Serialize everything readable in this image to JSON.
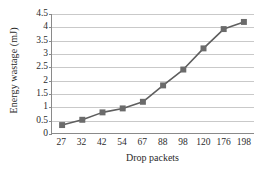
{
  "chart_data": {
    "type": "line",
    "title": "",
    "subtitle": "",
    "xlabel": "Drop packets",
    "ylabel": "Energy wastage (mJ)",
    "categories": [
      "27",
      "32",
      "42",
      "54",
      "67",
      "88",
      "98",
      "120",
      "176",
      "198"
    ],
    "values": [
      0.3,
      0.5,
      0.78,
      0.93,
      1.18,
      1.8,
      2.4,
      3.2,
      3.93,
      4.2
    ],
    "series": [
      {
        "name": "Energy wastage",
        "values": [
          0.3,
          0.5,
          0.78,
          0.93,
          1.18,
          1.8,
          2.4,
          3.2,
          3.93,
          4.2
        ]
      }
    ],
    "ylim": [
      0,
      4.5
    ],
    "yticks": [
      0,
      0.5,
      1,
      1.5,
      2,
      2.5,
      3,
      3.5,
      4,
      4.5
    ],
    "ytick_labels": [
      "0",
      "0.5",
      "1",
      "1.5",
      "2",
      "2.5",
      "3",
      "3.5",
      "4",
      "4.5"
    ],
    "xtick_labels": [
      "27",
      "32",
      "42",
      "54",
      "67",
      "88",
      "98",
      "120",
      "176",
      "198"
    ],
    "grid": true,
    "grid_axis": "y",
    "legend": false,
    "legend_position": "none",
    "marker": "square",
    "annotations": []
  },
  "style": {
    "line_color": "#5e5e5e",
    "marker_color": "#6b6b6b",
    "grid_color": "#c9c9c9",
    "axis_color": "#8a8a8a",
    "text_color": "#2b2b2b",
    "background": "#ffffff"
  }
}
